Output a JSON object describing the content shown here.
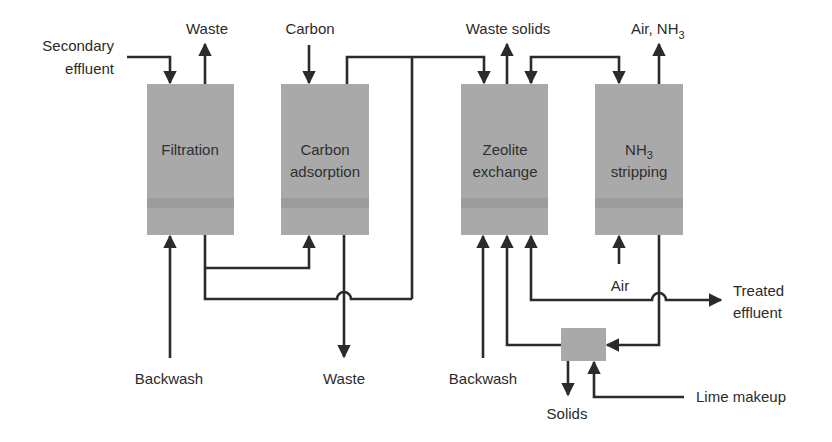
{
  "diagram": {
    "units": {
      "filtration": {
        "label": "Filtration"
      },
      "carbon": {
        "line1": "Carbon",
        "line2": "adsorption"
      },
      "zeolite": {
        "line1": "Zeolite",
        "line2": "exchange"
      },
      "nh3": {
        "line1_main": "NH",
        "line1_sub": "3",
        "line2": "stripping"
      },
      "lime": {
        "label": ""
      }
    },
    "streams": {
      "secondary_effluent": {
        "line1": "Secondary",
        "line2": "effluent"
      },
      "filtration_waste": "Waste",
      "carbon_in": "Carbon",
      "waste_solids": "Waste solids",
      "air_nh3": {
        "main": "Air, NH",
        "sub": "3"
      },
      "backwash_filtration": "Backwash",
      "carbon_waste": "Waste",
      "backwash_zeolite": "Backwash",
      "air_in": "Air",
      "treated_effluent": {
        "line1": "Treated",
        "line2": "effluent"
      },
      "solids": "Solids",
      "lime_makeup": "Lime makeup"
    },
    "colors": {
      "unit_fill": "#a9a9a9",
      "line": "#2b2b2b",
      "background": "#ffffff"
    }
  }
}
